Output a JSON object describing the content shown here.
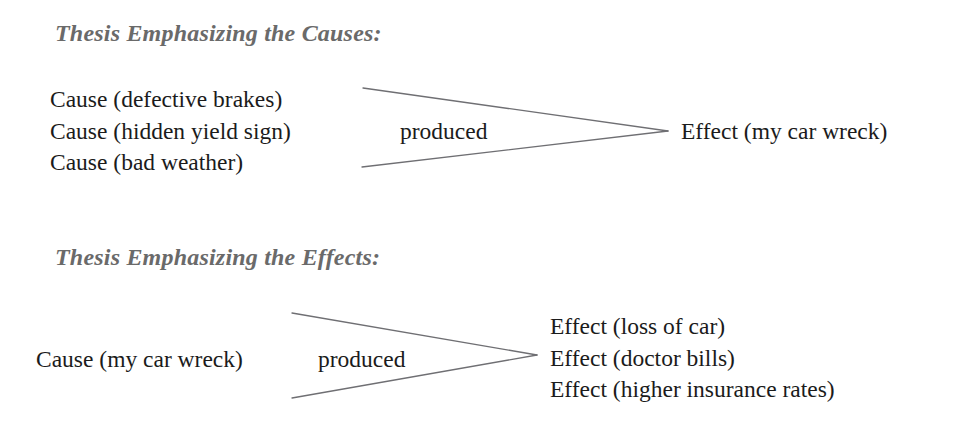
{
  "page": {
    "background_color": "#ffffff",
    "text_color": "#1b1b1b",
    "heading_color": "#6a6a6a",
    "arrow_color": "#6f6f73"
  },
  "diagrams": [
    {
      "heading": "Thesis Emphasizing the Causes:",
      "left_items": [
        "Cause (defective brakes)",
        "Cause (hidden yield sign)",
        "Cause (bad weather)"
      ],
      "connector_label": "produced",
      "right_items": [
        "Effect (my car wreck)"
      ],
      "arrow_direction": "converging"
    },
    {
      "heading": "Thesis Emphasizing the Effects:",
      "left_items": [
        "Cause (my car wreck)"
      ],
      "connector_label": "produced",
      "right_items": [
        "Effect (loss of car)",
        "Effect (doctor bills)",
        "Effect (higher insurance rates)"
      ],
      "arrow_direction": "diverging"
    }
  ]
}
